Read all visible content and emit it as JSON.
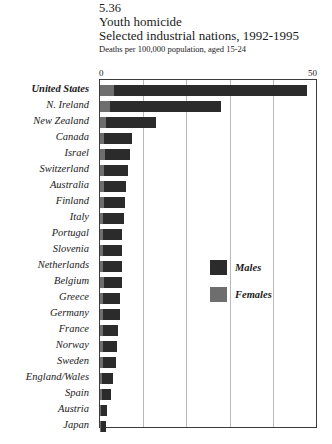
{
  "header": {
    "figure_number": "5.36",
    "title": "Youth homicide",
    "subtitle": "Selected industrial nations, 1992-1995",
    "units": "Deaths per 100,000 population, aged 15-24"
  },
  "axis": {
    "min_label": "0",
    "max_label": "50"
  },
  "legend": {
    "males_label": "Males",
    "females_label": "Females",
    "males_color": "#2b2b2b",
    "females_color": "#6e6e6e"
  },
  "chart_data": {
    "type": "bar",
    "orientation": "horizontal",
    "stacked": true,
    "title": "Youth homicide",
    "subtitle": "Selected industrial nations, 1992-1995",
    "xlabel": "Deaths per 100,000 population, aged 15-24",
    "ylabel": "",
    "xlim": [
      0,
      50
    ],
    "xticks": [
      0,
      10,
      20,
      30,
      40,
      50
    ],
    "xtick_labels": [
      "0",
      "",
      "",
      "",
      "",
      "50"
    ],
    "grid": true,
    "gridlines_at": [
      10,
      20,
      30,
      40
    ],
    "legend_position": "inside-center-right",
    "categories": [
      "United States",
      "N. Ireland",
      "New Zealand",
      "Canada",
      "Israel",
      "Switzerland",
      "Australia",
      "Finland",
      "Italy",
      "Portugal",
      "Slovenia",
      "Netherlands",
      "Belgium",
      "Greece",
      "Germany",
      "France",
      "Norway",
      "Sweden",
      "England/Wales",
      "Spain",
      "Austria",
      "Japan"
    ],
    "highlight_category": "United States",
    "series": [
      {
        "name": "Females",
        "color": "#6e6e6e",
        "values": [
          3.2,
          2.3,
          1.5,
          1.0,
          1.1,
          0.9,
          0.9,
          0.9,
          0.7,
          0.7,
          0.8,
          0.8,
          0.9,
          0.6,
          0.8,
          0.7,
          0.6,
          0.6,
          0.4,
          0.4,
          0.3,
          0.3
        ]
      },
      {
        "name": "Males",
        "color": "#2b2b2b",
        "values": [
          44.8,
          25.7,
          11.5,
          6.3,
          5.8,
          5.6,
          5.2,
          5.0,
          4.8,
          4.4,
          4.3,
          4.4,
          4.2,
          4.1,
          3.9,
          3.4,
          3.3,
          3.0,
          2.5,
          2.1,
          1.4,
          1.0
        ]
      }
    ],
    "totals": [
      48.0,
      28.0,
      13.0,
      7.3,
      6.9,
      6.5,
      6.1,
      5.9,
      5.5,
      5.1,
      5.1,
      5.2,
      5.1,
      4.7,
      4.7,
      4.1,
      3.9,
      3.6,
      2.9,
      2.5,
      1.7,
      1.3
    ]
  }
}
